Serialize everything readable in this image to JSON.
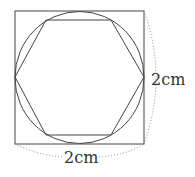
{
  "diagram": {
    "square": {
      "x": 15,
      "y": 11,
      "size": 129
    },
    "circle": {
      "cx": 79.5,
      "cy": 75.5,
      "r": 64
    },
    "hexagon_points": "47,20 112,20 143,77 112,135 47,135 15,77",
    "stroke_color": "#444444",
    "dim_color": "#777777",
    "labels": {
      "right_dimension": "2cm",
      "bottom_dimension": "2cm"
    }
  }
}
